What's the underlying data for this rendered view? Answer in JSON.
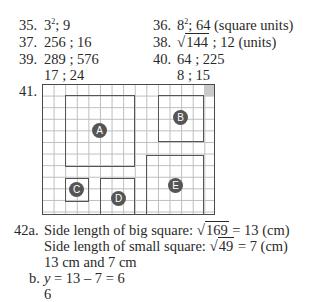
{
  "answers": {
    "q35": {
      "number": "35.",
      "base": "3",
      "exponent": "2",
      "rest": "; 9"
    },
    "q36": {
      "number": "36.",
      "base": "8",
      "exponent": "2",
      "rest": "; 64 (square units)"
    },
    "q37": {
      "number": "37.",
      "text": "256 ; 16"
    },
    "q38": {
      "number": "38.",
      "radicand": "144",
      "rest": "; 12 (units)"
    },
    "q39": {
      "number": "39.",
      "line1": "289 ; 576",
      "line2": "17 ; 24"
    },
    "q40": {
      "number": "40.",
      "line1": "64 ; 225",
      "line2": "8 ; 15"
    },
    "q41": {
      "number": "41.",
      "grid": {
        "columns": 15,
        "rows": 11,
        "shaded_corner": "top-right"
      },
      "squares": [
        {
          "label": "A",
          "col": 2,
          "row": 1,
          "size": 6
        },
        {
          "label": "B",
          "col": 10,
          "row": 1,
          "size": 4
        },
        {
          "label": "C",
          "col": 2,
          "row": 8,
          "size": 2
        },
        {
          "label": "D",
          "col": 5,
          "row": 8,
          "size": 3
        },
        {
          "label": "E",
          "col": 9,
          "row": 6,
          "size": 5
        }
      ]
    },
    "q42": {
      "number_a": "42a.",
      "big_prefix": "Side length of big square:",
      "big_radicand": "169",
      "big_result": "= 13 (cm)",
      "small_prefix": "Side length of small square:",
      "small_radicand": "49",
      "small_result": "= 7 (cm)",
      "answer_a": "13 cm and 7 cm",
      "number_b": "b.",
      "var_y": "y",
      "equation_b": "= 13 – 7 = 6",
      "answer_b": "6"
    }
  },
  "colors": {
    "text": "#2a2a2a",
    "grid_line": "#bdbdbd",
    "square_border": "#555555",
    "badge": "#555555",
    "corner_shade": "#c9c9c9"
  }
}
